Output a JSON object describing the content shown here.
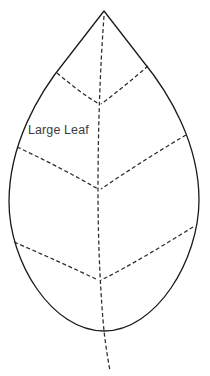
{
  "document": {
    "title": "Large Leaf",
    "background_color": "#ffffff",
    "width": 210,
    "height": 376
  },
  "label": {
    "text": "Large Leaf",
    "color": "#3c3c3c",
    "x": 28,
    "y": 134
  },
  "shape": {
    "name": "leaf-outline",
    "stroke_color": "#1a1a1a",
    "fill_color": "#ffffff",
    "stroke_width": 1.3,
    "apex_point": [
      104,
      11
    ],
    "leftmost_point": [
      9,
      202
    ],
    "rightmost_point": [
      199,
      200
    ],
    "bottom_point": [
      104,
      331
    ],
    "path": "M 104 11 L 66 60 C 38 94 9 145 9 202 C 9 262 52 331 104 331 C 156 331 199 260 199 200 C 199 144 170 94 142 60 Z"
  },
  "veins": {
    "stroke_color": "#2b2b2b",
    "stroke_width": 1.25,
    "dash_pattern": "4,2.6",
    "midrib": {
      "name": "midrib-vein",
      "path": "M 104 16 C 100 70 98 130 98 190 C 98 250 101 300 104 331 C 106 348 108 360 110 371"
    },
    "lateral": [
      {
        "name": "vein-upper-left",
        "side": "left",
        "path": "M 57 73 C 70 84 84 95 99 104"
      },
      {
        "name": "vein-upper-right",
        "side": "right",
        "path": "M 148 66 C 133 79 116 93 101 104"
      },
      {
        "name": "vein-middle-left",
        "side": "left",
        "path": "M 17 147 C 45 160 74 175 98 189"
      },
      {
        "name": "vein-middle-right",
        "side": "right",
        "path": "M 186 135 C 157 152 126 172 101 189"
      },
      {
        "name": "vein-lower-left",
        "side": "left",
        "path": "M 14 242 C 44 255 73 268 98 280"
      },
      {
        "name": "vein-lower-right",
        "side": "right",
        "path": "M 193 227 C 164 245 128 267 101 280"
      }
    ]
  }
}
